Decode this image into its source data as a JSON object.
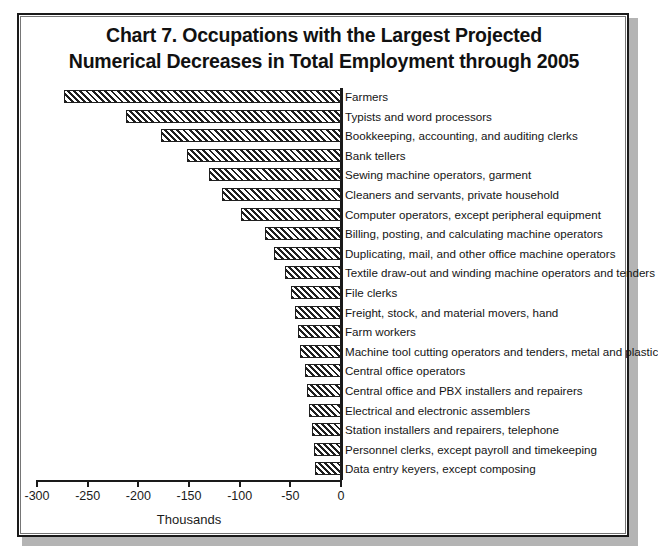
{
  "title": {
    "line1": "Chart 7. Occupations with the Largest Projected",
    "line2": "Numerical Decreases in Total Employment through 2005"
  },
  "chart_data": {
    "type": "bar",
    "orientation": "horizontal",
    "title": "Chart 7. Occupations with the Largest Projected Numerical Decreases in Total Employment through 2005",
    "xlabel": "Thousands",
    "ylabel": "",
    "xlim": [
      -300,
      0
    ],
    "xticks": [
      -300,
      -250,
      -200,
      -150,
      -100,
      -50,
      0
    ],
    "xtick_labels": [
      "-300",
      "-250",
      "-200",
      "-150",
      "-100",
      "-50",
      "0"
    ],
    "grid": false,
    "legend": false,
    "bar_fill": "diagonal-hatch",
    "categories": [
      "Farmers",
      "Typists and word processors",
      "Bookkeeping, accounting, and auditing clerks",
      "Bank tellers",
      "Sewing machine operators, garment",
      "Cleaners and servants, private household",
      "Computer operators, except peripheral equipment",
      "Billing, posting, and calculating machine operators",
      "Duplicating, mail, and other office machine operators",
      "Textile draw-out and winding machine operators and tenders",
      "File clerks",
      "Freight, stock, and material movers, hand",
      "Farm workers",
      "Machine tool cutting operators and tenders, metal and plastic",
      "Central office operators",
      "Central office and PBX installers and repairers",
      "Electrical and electronic assemblers",
      "Station installers and repairers, telephone",
      "Personnel clerks, except payroll and timekeeping",
      "Data entry keyers, except composing"
    ],
    "values": [
      -273,
      -212,
      -178,
      -152,
      -130,
      -117,
      -99,
      -75,
      -66,
      -55,
      -49,
      -45,
      -42,
      -40,
      -36,
      -34,
      -32,
      -29,
      -27,
      -26
    ]
  },
  "axis": {
    "xlabel": "Thousands"
  }
}
